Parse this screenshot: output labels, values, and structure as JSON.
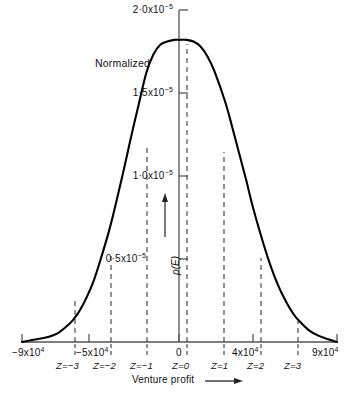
{
  "chart_data": {
    "type": "line",
    "title": "",
    "annotation": "Normalized",
    "xlabel": "Venture profit",
    "ylabel": "ρ(E)",
    "xlim": [
      -90000,
      90000
    ],
    "ylim": [
      0,
      2e-05
    ],
    "grid": false,
    "legend": null,
    "x_ticks": [
      {
        "value": -90000,
        "label": "−9x10",
        "exponent": "4"
      },
      {
        "value": -50000,
        "label": "−5x10",
        "exponent": "4"
      },
      {
        "value": 0,
        "label": "0",
        "exponent": ""
      },
      {
        "value": 40000,
        "label": "4x10",
        "exponent": "4"
      },
      {
        "value": 90000,
        "label": "9x10",
        "exponent": "4"
      }
    ],
    "y_ticks": [
      {
        "value": 5e-06,
        "mantissa": "0·5",
        "label": "0·5x10",
        "exponent": "−5"
      },
      {
        "value": 1e-05,
        "mantissa": "1·0",
        "label": "1·0x10",
        "exponent": "−5"
      },
      {
        "value": 1.5e-05,
        "mantissa": "1·5",
        "label": "1·5x10",
        "exponent": "−5"
      },
      {
        "value": 2e-05,
        "mantissa": "2·0",
        "label": "2·0x10",
        "exponent": "−5"
      }
    ],
    "z_markers": [
      {
        "z": -3,
        "label": "Z=−3",
        "x": -61000
      },
      {
        "z": -2,
        "label": "Z=−2",
        "x": -40000
      },
      {
        "z": -1,
        "label": "Z=−1",
        "x": -19000
      },
      {
        "z": 0,
        "label": "Z=0",
        "x": 4000
      },
      {
        "z": 1,
        "label": "Z=1",
        "x": 26000
      },
      {
        "z": 2,
        "label": "Z=2",
        "x": 48000
      },
      {
        "z": 3,
        "label": "Z=3",
        "x": 69000
      }
    ],
    "series": [
      {
        "name": "Normalized probability density",
        "mean": 4000,
        "sigma": 22000,
        "peak": 1.82e-05,
        "x": [
          -90000,
          -85000,
          -80000,
          -75000,
          -70000,
          -65000,
          -61000,
          -57000,
          -53000,
          -49000,
          -45000,
          -40000,
          -36000,
          -32000,
          -28000,
          -24000,
          -19000,
          -15000,
          -11000,
          -7000,
          -3000,
          0,
          4000,
          8000,
          12000,
          16000,
          20000,
          26000,
          30000,
          34000,
          38000,
          42000,
          48000,
          52000,
          56000,
          60000,
          65000,
          69000,
          74000,
          79000,
          84000,
          90000
        ],
        "y": [
          0.0,
          1e-07,
          2e-07,
          3e-07,
          5e-07,
          9e-07,
          1.3e-06,
          1.9e-06,
          2.7e-06,
          3.7e-06,
          5e-06,
          6.8e-06,
          8.5e-06,
          1.03e-05,
          1.22e-05,
          1.4e-05,
          1.62e-05,
          1.73e-05,
          1.79e-05,
          1.81e-05,
          1.82e-05,
          1.82e-05,
          1.82e-05,
          1.81e-05,
          1.78e-05,
          1.72e-05,
          1.63e-05,
          1.45e-05,
          1.3e-05,
          1.14e-05,
          9.8e-06,
          8.1e-06,
          5.9e-06,
          4.6e-06,
          3.5e-06,
          2.6e-06,
          1.7e-06,
          1.2e-06,
          7e-07,
          4e-07,
          2e-07,
          0.0
        ]
      }
    ]
  },
  "figure": {
    "annotation_text": "Normalized",
    "xaxis_title": "Venture profit",
    "yaxis_title": "ρ(E)",
    "y_tick_labels": [
      "2·0x10",
      "1·5x10",
      "1·0x10",
      "0·5x10"
    ],
    "y_tick_exponent": "−5",
    "x_tick_labels": [
      "−9x10",
      "−5x10",
      "0",
      "4x10",
      "9x10"
    ],
    "x_tick_exponent": "4",
    "z_labels": [
      "Z=−3",
      "Z=−2",
      "Z=−1",
      "Z=0",
      "Z=1",
      "Z=2",
      "Z=3"
    ],
    "curve_color": "#000000",
    "axis_color": "#555555",
    "dash_color": "#444444"
  }
}
